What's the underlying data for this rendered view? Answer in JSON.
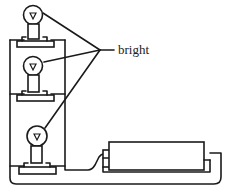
{
  "figure": {
    "type": "circuit-diagram",
    "label": "bright",
    "components": [
      {
        "name": "bulb-1",
        "state": "bright"
      },
      {
        "name": "bulb-2",
        "state": "bright"
      },
      {
        "name": "bulb-3",
        "state": "bright"
      },
      {
        "name": "battery"
      }
    ],
    "colors": {
      "line": "#1a1a1a",
      "background": "#ffffff"
    }
  }
}
